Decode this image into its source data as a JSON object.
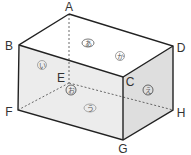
{
  "diagram": {
    "vertices": [
      {
        "label": "A",
        "x": 69,
        "y": 10,
        "lx": 69,
        "ly": 12
      },
      {
        "label": "B",
        "x": 19,
        "y": 45,
        "lx": 9,
        "ly": 49
      },
      {
        "label": "C",
        "x": 123,
        "y": 77,
        "lx": 128,
        "ly": 85
      },
      {
        "label": "D",
        "x": 173,
        "y": 46,
        "lx": 180,
        "ly": 50
      },
      {
        "label": "E",
        "x": 68,
        "y": 83,
        "lx": 61,
        "ly": 83
      },
      {
        "label": "F",
        "x": 18,
        "y": 110,
        "lx": 9,
        "ly": 114
      },
      {
        "label": "G",
        "x": 123,
        "y": 140,
        "lx": 123,
        "ly": 153
      },
      {
        "label": "H",
        "x": 173,
        "y": 110,
        "lx": 181,
        "ly": 118
      }
    ],
    "faces": [
      {
        "name": "top",
        "label": "あ",
        "x": 88,
        "y": 43
      },
      {
        "name": "top-back",
        "label": "か",
        "x": 120,
        "y": 56
      },
      {
        "name": "front",
        "label": "い",
        "x": 42,
        "y": 65
      },
      {
        "name": "bottom-at-E",
        "label": "お",
        "x": 70,
        "y": 90
      },
      {
        "name": "right",
        "label": "え",
        "x": 148,
        "y": 90
      },
      {
        "name": "bottom",
        "label": "う",
        "x": 90,
        "y": 108
      }
    ],
    "colors": {
      "edge": "#222222",
      "top_face": "#ffffff",
      "front_face": "#ececec",
      "right_face": "#dedede",
      "hidden_edge": "#444444"
    }
  }
}
